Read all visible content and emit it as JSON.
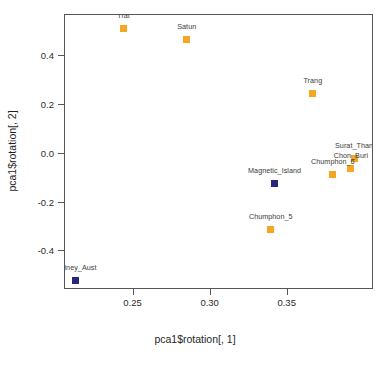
{
  "chart_data": {
    "type": "scatter",
    "title": "",
    "xlabel": "pca1$rotation[, 1]",
    "ylabel": "pca1$rotation[, 2]",
    "xlim": [
      0.2055,
      0.406
    ],
    "ylim": [
      -0.558,
      0.568
    ],
    "xticks": [
      0.25,
      0.3,
      0.35
    ],
    "xticklabels": [
      "0.25",
      "0.30",
      "0.35"
    ],
    "yticks": [
      0.4,
      0.2,
      0.0,
      -0.2,
      -0.4
    ],
    "yticklabels": [
      "0.4",
      "0.2",
      "0.0",
      "-0.2",
      "-0.4"
    ],
    "grid": false,
    "legend": null,
    "marker": "square",
    "colors": {
      "orange": "#F5A623",
      "navy": "#26267A",
      "axis": "#555555",
      "text": "#2b2b2b",
      "label_text": "#3a3a3a"
    },
    "points": [
      {
        "name": "Trat",
        "x": 0.2435,
        "y": 0.512,
        "color": "#F5A623",
        "group": "thailand",
        "label_dx": 0,
        "label_dy": -5
      },
      {
        "name": "Satun",
        "x": 0.2845,
        "y": 0.468,
        "color": "#F5A623",
        "group": "thailand",
        "label_dx": 0,
        "label_dy": -5
      },
      {
        "name": "Trang",
        "x": 0.3663,
        "y": 0.248,
        "color": "#F5A623",
        "group": "thailand",
        "label_dx": 0,
        "label_dy": -5
      },
      {
        "name": "Surat_Thani",
        "x": 0.3936,
        "y": -0.02,
        "color": "#F5A623",
        "group": "thailand",
        "label_dx": 0,
        "label_dy": -5
      },
      {
        "name": "Chon_Buri",
        "x": 0.391,
        "y": -0.06,
        "color": "#F5A623",
        "group": "thailand",
        "label_dx": 0,
        "label_dy": -5
      },
      {
        "name": "Chumphon_6",
        "x": 0.3793,
        "y": -0.084,
        "color": "#F5A623",
        "group": "thailand",
        "label_dx": 0,
        "label_dy": -5
      },
      {
        "name": "Magnetic_Island",
        "x": 0.3415,
        "y": -0.12,
        "color": "#26267A",
        "group": "australia",
        "label_dx": 0,
        "label_dy": -5
      },
      {
        "name": "Chumphon_5",
        "x": 0.339,
        "y": -0.312,
        "color": "#F5A623",
        "group": "thailand",
        "label_dx": 0,
        "label_dy": -5
      },
      {
        "name": "Sydney_Aust",
        "x": 0.212,
        "y": -0.52,
        "color": "#26267A",
        "group": "australia",
        "label_dx": 0,
        "label_dy": -5
      }
    ]
  }
}
